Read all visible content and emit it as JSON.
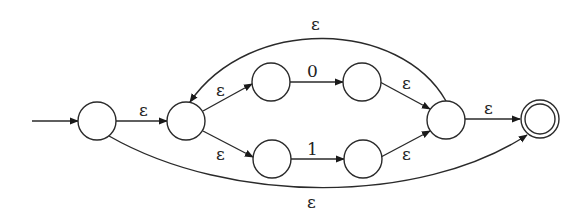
{
  "diagram": {
    "type": "nfa",
    "states": [
      {
        "id": "q0",
        "start": true,
        "accept": false
      },
      {
        "id": "q1",
        "start": false,
        "accept": false
      },
      {
        "id": "q2",
        "start": false,
        "accept": false
      },
      {
        "id": "q3",
        "start": false,
        "accept": false
      },
      {
        "id": "q4",
        "start": false,
        "accept": false
      },
      {
        "id": "q5",
        "start": false,
        "accept": false
      },
      {
        "id": "q6",
        "start": false,
        "accept": false
      },
      {
        "id": "q7",
        "start": false,
        "accept": true
      }
    ],
    "edges": [
      {
        "from": "q0",
        "to": "q1",
        "label": "ε"
      },
      {
        "from": "q1",
        "to": "q2",
        "label": "ε"
      },
      {
        "from": "q1",
        "to": "q4",
        "label": "ε"
      },
      {
        "from": "q2",
        "to": "q3",
        "label": "0"
      },
      {
        "from": "q4",
        "to": "q5",
        "label": "1"
      },
      {
        "from": "q3",
        "to": "q6",
        "label": "ε"
      },
      {
        "from": "q5",
        "to": "q6",
        "label": "ε"
      },
      {
        "from": "q6",
        "to": "q1",
        "label": "ε"
      },
      {
        "from": "q6",
        "to": "q7",
        "label": "ε"
      },
      {
        "from": "q0",
        "to": "q7",
        "label": "ε"
      }
    ]
  }
}
